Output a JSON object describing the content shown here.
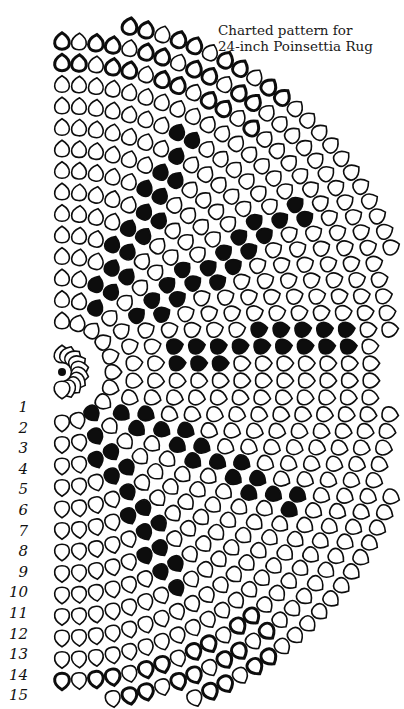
{
  "title": {
    "line1": "Charted pattern for",
    "line2": "24-inch Poinsettia Rug"
  },
  "chart": {
    "center": [
      62,
      372
    ],
    "rows": 15,
    "ink_color": "#0d0d0d",
    "paper_color": "#ffffff",
    "row_labels": [
      "1",
      "2",
      "3",
      "4",
      "5",
      "6",
      "7",
      "8",
      "9",
      "10",
      "11",
      "12",
      "13",
      "14",
      "15"
    ],
    "legend": {
      "open_petal": "outlined stitch",
      "solid_petal": "filled stitch"
    },
    "petal_layers": [
      {
        "name": "dark-border-top",
        "description": "outer rows 13-15 filled-outline along top arc"
      },
      {
        "name": "upper-leaf",
        "description": "solid petals band from center toward upper left"
      },
      {
        "name": "upper-center-leaf",
        "description": "solid petals band toward upper right"
      },
      {
        "name": "middle-leaf",
        "description": "solid petals band toward right"
      },
      {
        "name": "lower-leaf",
        "description": "solid petals band toward lower left"
      },
      {
        "name": "dark-border-bottom",
        "description": "outer rows 13-15 filled-outline along bottom arc"
      }
    ]
  }
}
